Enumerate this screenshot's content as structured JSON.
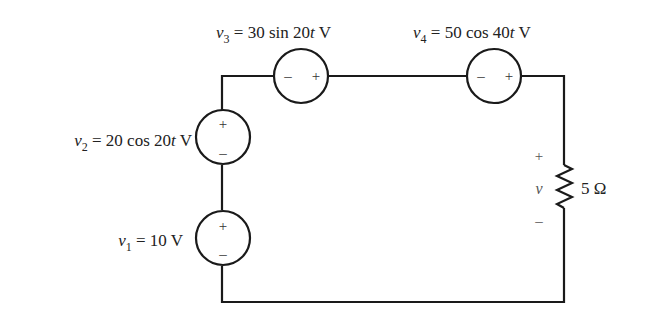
{
  "circuit": {
    "topology": "single series loop",
    "sources": [
      {
        "id": "v1",
        "name": "v",
        "subscript": "1",
        "expr": " = 10 V",
        "plus": "+",
        "minus": "–",
        "orientation": "vertical, + on top",
        "position": "left branch, lower"
      },
      {
        "id": "v2",
        "name": "v",
        "subscript": "2",
        "expr_a": " = 20 cos 20",
        "expr_t": "t",
        "expr_b": " V",
        "plus": "+",
        "minus": "–",
        "orientation": "vertical, + on top",
        "position": "left branch, upper"
      },
      {
        "id": "v3",
        "name": "v",
        "subscript": "3",
        "expr_a": " = 30 sin 20",
        "expr_t": "t",
        "expr_b": " V",
        "plus": "+",
        "minus": "–",
        "orientation": "horizontal, − left, + right",
        "position": "top branch, left"
      },
      {
        "id": "v4",
        "name": "v",
        "subscript": "4",
        "expr_a": " = 50 cos 40",
        "expr_t": "t",
        "expr_b": " V",
        "plus": "+",
        "minus": "–",
        "orientation": "horizontal, − left, + right",
        "position": "top branch, right"
      }
    ],
    "resistor": {
      "value_label": "5 Ω",
      "voltage_label": "v",
      "plus": "+",
      "minus": "–",
      "position": "right branch"
    }
  },
  "colors": {
    "wire": "#1a1a1a",
    "text": "#222222",
    "background": "#ffffff"
  }
}
